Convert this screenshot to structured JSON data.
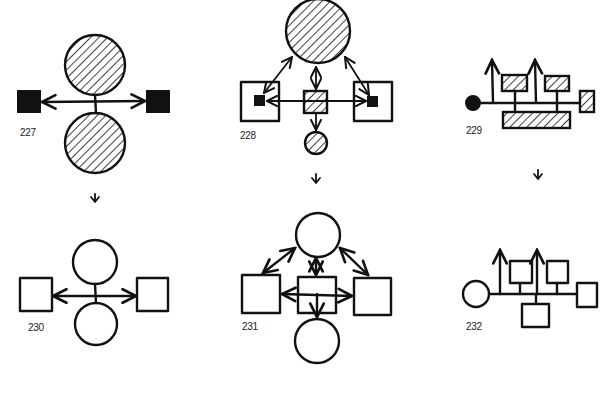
{
  "figures": [
    {
      "id": "227",
      "label": "227",
      "row": "top",
      "style": "hatched",
      "description": "two hatched circles joined by vertical axis, double-headed horizontal arrow to black squares"
    },
    {
      "id": "228",
      "label": "228",
      "row": "top",
      "style": "hatched",
      "description": "large hatched circle linked by arrows to hatched central square and two framed black squares, small hatched circle below"
    },
    {
      "id": "229",
      "label": "229",
      "row": "top",
      "style": "hatched",
      "description": "black dot with linear spine, two upward arrows, hatched boxes branching off"
    },
    {
      "id": "230",
      "label": "230",
      "row": "bottom",
      "style": "outline",
      "description": "two outline circles on vertical axis, double-headed horizontal arrow to two outline squares"
    },
    {
      "id": "231",
      "label": "231",
      "row": "bottom",
      "style": "outline",
      "description": "top circle with arrows to three squares, center square with arrow to bottom circle"
    },
    {
      "id": "232",
      "label": "232",
      "row": "bottom",
      "style": "outline",
      "description": "outline circle with linear spine, two upward arrows, outline squares branching off"
    }
  ],
  "transition_arrows": [
    {
      "from": "227",
      "to": "230",
      "glyph": "down-arrow"
    },
    {
      "from": "228",
      "to": "231",
      "glyph": "down-arrow"
    },
    {
      "from": "229",
      "to": "232",
      "glyph": "down-arrow"
    }
  ],
  "colors": {
    "ink": "#111111",
    "background": "#ffffff"
  }
}
